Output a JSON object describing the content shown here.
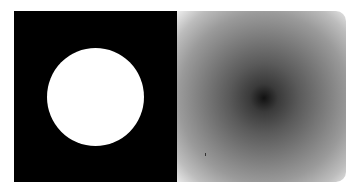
{
  "figure": {
    "left_panel": {
      "label": "white disk on black background",
      "background_color": "#000000",
      "disk_color": "#ffffff",
      "disk_center_px": [
        95,
        97
      ],
      "disk_radius_px": 48
    },
    "right_panel": {
      "label": "radial gradient magnitude image",
      "center_color": "#111111",
      "mid_color": "#6a6a6a",
      "edge_color": "#d8d8d8",
      "corner_color": "#ffffff",
      "center_px": [
        264,
        98
      ]
    }
  }
}
